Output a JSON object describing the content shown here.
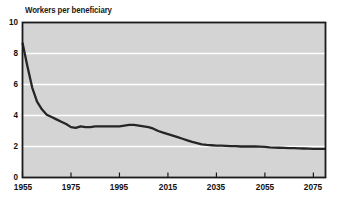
{
  "chart_data": {
    "type": "line",
    "title": "Workers per beneficiary",
    "xlabel": "",
    "ylabel": "",
    "grid": true,
    "legend_position": "none",
    "xlim": [
      1955,
      2080
    ],
    "ylim": [
      0,
      10
    ],
    "ytick_labels": [
      "0",
      "2",
      "4",
      "6",
      "8",
      "10"
    ],
    "ytick_values": [
      0,
      2,
      4,
      6,
      8,
      10
    ],
    "xtick_labels": [
      "1955",
      "1975",
      "1995",
      "2015",
      "2035",
      "2055",
      "2075"
    ],
    "xtick_values": [
      1955,
      1975,
      1995,
      2015,
      2035,
      2055,
      2075
    ],
    "series": [
      {
        "name": "Workers per beneficiary",
        "color": "#262626",
        "x": [
          1955,
          1957,
          1959,
          1961,
          1963,
          1965,
          1967,
          1969,
          1971,
          1973,
          1975,
          1977,
          1979,
          1981,
          1983,
          1985,
          1987,
          1989,
          1991,
          1993,
          1995,
          1997,
          1999,
          2001,
          2003,
          2005,
          2007,
          2009,
          2011,
          2013,
          2015,
          2017,
          2019,
          2021,
          2023,
          2025,
          2027,
          2029,
          2031,
          2033,
          2035,
          2037,
          2039,
          2041,
          2043,
          2045,
          2047,
          2049,
          2051,
          2053,
          2055,
          2057,
          2059,
          2061,
          2063,
          2065,
          2067,
          2069,
          2071,
          2073,
          2075,
          2077,
          2080
        ],
        "y": [
          8.7,
          7.2,
          5.8,
          4.9,
          4.4,
          4.05,
          3.9,
          3.75,
          3.6,
          3.45,
          3.25,
          3.2,
          3.3,
          3.25,
          3.25,
          3.3,
          3.3,
          3.3,
          3.3,
          3.3,
          3.3,
          3.35,
          3.4,
          3.4,
          3.35,
          3.3,
          3.25,
          3.15,
          3.0,
          2.9,
          2.8,
          2.7,
          2.6,
          2.5,
          2.4,
          2.3,
          2.22,
          2.14,
          2.1,
          2.08,
          2.06,
          2.05,
          2.04,
          2.03,
          2.02,
          2.0,
          2.0,
          2.0,
          2.0,
          1.99,
          1.98,
          1.95,
          1.93,
          1.92,
          1.91,
          1.9,
          1.89,
          1.88,
          1.87,
          1.86,
          1.85,
          1.85,
          1.85
        ]
      }
    ],
    "colors": {
      "plot_background": "#d4d4d4",
      "gridline": "#ffffff",
      "axis_frame": "#1a1a1a",
      "line": "#262626",
      "page_background": "#ffffff"
    }
  }
}
